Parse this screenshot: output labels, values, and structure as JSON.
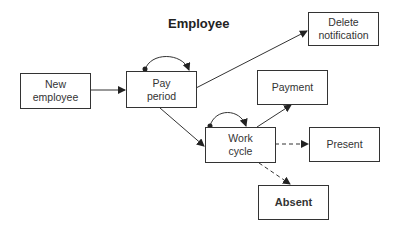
{
  "title": "Employee",
  "nodes": {
    "new_employee": {
      "label": "New\nemployee"
    },
    "pay_period": {
      "label": "Pay\nperiod"
    },
    "delete_notification": {
      "label": "Delete\nnotification"
    },
    "payment": {
      "label": "Payment"
    },
    "work_cycle": {
      "label": "Work\ncycle"
    },
    "present": {
      "label": "Present"
    },
    "absent": {
      "label": "Absent"
    }
  },
  "edges": [
    {
      "from": "New employee",
      "to": "Pay period",
      "style": "solid"
    },
    {
      "from": "Pay period",
      "to": "Pay period",
      "style": "self-loop"
    },
    {
      "from": "Pay period",
      "to": "Delete notification",
      "style": "solid"
    },
    {
      "from": "Pay period",
      "to": "Work cycle",
      "style": "solid"
    },
    {
      "from": "Work cycle",
      "to": "Work cycle",
      "style": "self-loop"
    },
    {
      "from": "Work cycle",
      "to": "Payment",
      "style": "solid"
    },
    {
      "from": "Work cycle",
      "to": "Present",
      "style": "dashed"
    },
    {
      "from": "Work cycle",
      "to": "Absent",
      "style": "dashed"
    }
  ]
}
